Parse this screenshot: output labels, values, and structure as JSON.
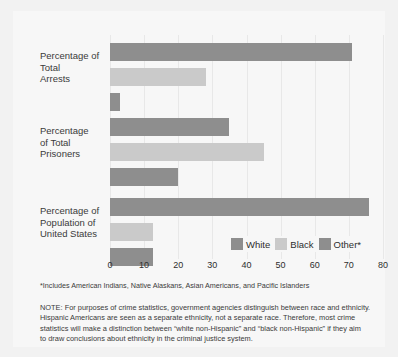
{
  "chart_data": {
    "type": "bar",
    "orientation": "horizontal",
    "title": "",
    "xlabel": "",
    "ylabel": "",
    "xlim": [
      0,
      80
    ],
    "xticks": [
      0,
      10,
      20,
      30,
      40,
      50,
      60,
      70,
      80
    ],
    "grid": true,
    "legend_position": "inside-bottom-right",
    "categories": [
      "Percentage of Total Arrests",
      "Percentage of Total Prisoners",
      "Percentage of Population of United States"
    ],
    "category_label_lines": [
      [
        "Percentage of",
        "Total",
        "Arrests"
      ],
      [
        "Percentage",
        "of Total",
        "Prisoners"
      ],
      [
        "Percentage of",
        "Population of",
        "United States"
      ]
    ],
    "series": [
      {
        "name": "White",
        "color": "#8e8e8e",
        "values": [
          71,
          35,
          76
        ]
      },
      {
        "name": "Black",
        "color": "#cacaca",
        "values": [
          28,
          45,
          12.5
        ]
      },
      {
        "name": "Other*",
        "color": "#8e8e8e",
        "values": [
          3,
          20,
          12.5
        ]
      }
    ]
  },
  "legend": {
    "items": [
      {
        "label": "White",
        "color": "#8e8e8e"
      },
      {
        "label": "Black",
        "color": "#cacaca"
      },
      {
        "label": "Other*",
        "color": "#8e8e8e"
      }
    ]
  },
  "footnote": "*Includes American Indians, Native Alaskans, Asian Americans, and Pacific Islanders",
  "note": {
    "lines": [
      "NOTE:  For purposes of crime statistics, government agencies distinguish between race and ethnicity.",
      "Hispanic Americans are seen as a separate ethnicity, not a separate race.  Therefore, most crime",
      "statistics will make a distinction between “white non-Hispanic” and “black non-Hispanic” if they aim",
      "to draw conclusions about ethnicity in the criminal justice system."
    ]
  },
  "colors": {
    "background": "#f2f2f2",
    "panel": "#f7f7f7",
    "gridline": "#e8e8e8",
    "text": "#2e2e2e",
    "series_white": "#8e8e8e",
    "series_black": "#cacaca",
    "series_other": "#8e8e8e"
  }
}
